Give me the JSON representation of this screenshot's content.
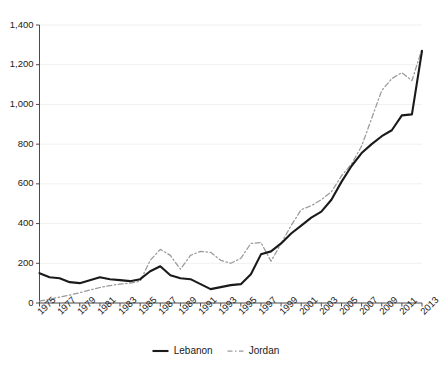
{
  "chart_data": {
    "type": "line",
    "title": "",
    "xlabel": "",
    "ylabel": "",
    "x": [
      1975,
      1976,
      1977,
      1978,
      1979,
      1980,
      1981,
      1982,
      1983,
      1984,
      1985,
      1986,
      1987,
      1988,
      1989,
      1990,
      1991,
      1992,
      1993,
      1994,
      1995,
      1996,
      1997,
      1998,
      1999,
      2000,
      2001,
      2002,
      2003,
      2004,
      2005,
      2006,
      2007,
      2008,
      2009,
      2010,
      2011,
      2012,
      2013
    ],
    "xticks": [
      "1975",
      "1977",
      "1979",
      "1981",
      "1983",
      "1985",
      "1987",
      "1989",
      "1991",
      "1993",
      "1995",
      "1997",
      "1999",
      "2001",
      "2003",
      "2005",
      "2007",
      "2009",
      "2011",
      "2013"
    ],
    "yticks": [
      "0",
      "200",
      "400",
      "600",
      "800",
      "1,000",
      "1,200",
      "1,400"
    ],
    "ylim": [
      0,
      1400
    ],
    "xlim": [
      1975,
      2013
    ],
    "grid": "horizontal",
    "legend_position": "bottom-center",
    "series": [
      {
        "name": "Lebanon",
        "style": "solid",
        "color": "#1a1a1a",
        "values": [
          150,
          130,
          125,
          105,
          100,
          115,
          130,
          120,
          115,
          110,
          120,
          160,
          185,
          140,
          125,
          120,
          95,
          70,
          80,
          90,
          95,
          145,
          245,
          260,
          300,
          350,
          390,
          430,
          460,
          520,
          610,
          690,
          755,
          800,
          840,
          870,
          945,
          950,
          1270
        ]
      },
      {
        "name": "Jordan",
        "style": "dash-dot",
        "color": "#9a9a9a",
        "values": [
          10,
          18,
          30,
          40,
          52,
          65,
          78,
          88,
          95,
          100,
          110,
          215,
          270,
          240,
          170,
          240,
          260,
          255,
          215,
          200,
          225,
          300,
          305,
          210,
          300,
          390,
          470,
          490,
          520,
          560,
          640,
          700,
          790,
          930,
          1070,
          1130,
          1160,
          1120,
          1280
        ]
      }
    ]
  },
  "legend": {
    "items": [
      {
        "label": "Lebanon",
        "style": "solid"
      },
      {
        "label": "Jordan",
        "style": "dash-dot"
      }
    ]
  },
  "colors": {
    "lebanon": "#1a1a1a",
    "jordan": "#9a9a9a",
    "axis": "#4a4a4a",
    "grid": "#f0f0f0",
    "background": "#ffffff",
    "text": "#1a1a1a"
  }
}
